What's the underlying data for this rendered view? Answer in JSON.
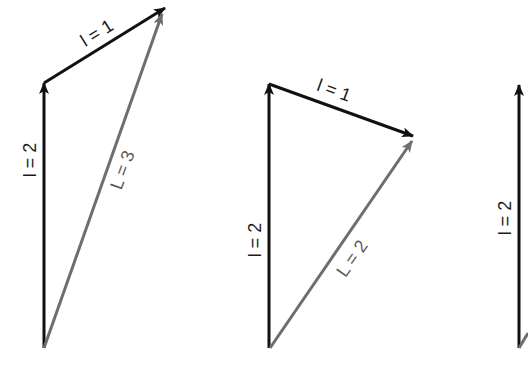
{
  "diagram": {
    "title": "",
    "colors": {
      "l_vector": "#111111",
      "L_vector": "#6e6e6e",
      "background": "#ffffff"
    },
    "panels": [
      {
        "id": "panel-L3",
        "vectors": [
          {
            "role": "l1",
            "label": "l = 2",
            "from": [
              44,
              348
            ],
            "to": [
              44,
              83
            ]
          },
          {
            "role": "l2",
            "label": "l = 1",
            "from": [
              44,
              83
            ],
            "to": [
              165,
              8
            ]
          },
          {
            "role": "total",
            "label": "L = 3",
            "from": [
              44,
              348
            ],
            "to": [
              162,
              14
            ]
          }
        ]
      },
      {
        "id": "panel-L2",
        "vectors": [
          {
            "role": "l1",
            "label": "l = 2",
            "from": [
              269,
              348
            ],
            "to": [
              269,
              84
            ]
          },
          {
            "role": "l2",
            "label": "l = 1",
            "from": [
              269,
              84
            ],
            "to": [
              413,
              136
            ]
          },
          {
            "role": "total",
            "label": "L = 2",
            "from": [
              270,
              348
            ],
            "to": [
              412,
              141
            ]
          }
        ]
      },
      {
        "id": "panel-L1-partial",
        "vectors": [
          {
            "role": "l1",
            "label": "l = 2",
            "from": [
              519,
              348
            ],
            "to": [
              519,
              85
            ]
          }
        ]
      }
    ]
  }
}
